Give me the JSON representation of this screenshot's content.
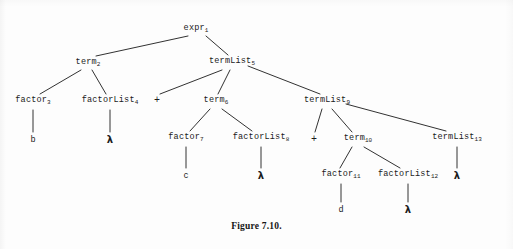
{
  "figure": {
    "caption": "Figure 7.10.",
    "width": 513,
    "height": 249,
    "background_color": "#fdfdfd",
    "ink_color": "#1b1b1b"
  },
  "tree": {
    "nodes": [
      {
        "id": "n1",
        "label": "expr",
        "subscript": "1",
        "x": 196,
        "y": 29
      },
      {
        "id": "n2",
        "label": "term",
        "subscript": "2",
        "x": 88,
        "y": 63
      },
      {
        "id": "n3",
        "label": "factor",
        "subscript": "3",
        "x": 33,
        "y": 101
      },
      {
        "id": "n4",
        "label": "factorList",
        "subscript": "4",
        "x": 110,
        "y": 101
      },
      {
        "id": "n5",
        "label": "termList",
        "subscript": "5",
        "x": 232,
        "y": 62
      },
      {
        "id": "n6",
        "label": "term",
        "subscript": "6",
        "x": 216,
        "y": 101
      },
      {
        "id": "n7",
        "label": "factor",
        "subscript": "7",
        "x": 186,
        "y": 138
      },
      {
        "id": "n8",
        "label": "factorList",
        "subscript": "8",
        "x": 261,
        "y": 138
      },
      {
        "id": "n9",
        "label": "termList",
        "subscript": "9",
        "x": 327,
        "y": 101
      },
      {
        "id": "n10",
        "label": "term",
        "subscript": "10",
        "x": 358,
        "y": 139
      },
      {
        "id": "n11",
        "label": "factor",
        "subscript": "11",
        "x": 341,
        "y": 175
      },
      {
        "id": "n12",
        "label": "factorList",
        "subscript": "12",
        "x": 408,
        "y": 175
      },
      {
        "id": "n13",
        "label": "termList",
        "subscript": "13",
        "x": 457,
        "y": 138
      }
    ],
    "terminals": [
      {
        "id": "t1",
        "text": "b",
        "kind": "symbol",
        "x": 33,
        "y": 140
      },
      {
        "id": "t2",
        "text": "λ",
        "kind": "lambda",
        "x": 110,
        "y": 140
      },
      {
        "id": "t3",
        "text": "+",
        "kind": "plus",
        "x": 157,
        "y": 101
      },
      {
        "id": "t4",
        "text": "c",
        "kind": "symbol",
        "x": 186,
        "y": 176
      },
      {
        "id": "t5",
        "text": "λ",
        "kind": "lambda",
        "x": 261,
        "y": 176
      },
      {
        "id": "t6",
        "text": "+",
        "kind": "plus",
        "x": 314,
        "y": 140
      },
      {
        "id": "t7",
        "text": "d",
        "kind": "symbol",
        "x": 341,
        "y": 210
      },
      {
        "id": "t8",
        "text": "λ",
        "kind": "lambda",
        "x": 408,
        "y": 210
      },
      {
        "id": "t9",
        "text": "λ",
        "kind": "lambda",
        "x": 457,
        "y": 176
      }
    ],
    "edges": [
      {
        "from": "n1",
        "to": "n2",
        "x1": 188,
        "y1": 36,
        "x2": 96,
        "y2": 56
      },
      {
        "from": "n1",
        "to": "n5",
        "x1": 206,
        "y1": 36,
        "x2": 228,
        "y2": 55
      },
      {
        "from": "n2",
        "to": "n3",
        "x1": 81,
        "y1": 70,
        "x2": 40,
        "y2": 94
      },
      {
        "from": "n2",
        "to": "n4",
        "x1": 92,
        "y1": 70,
        "x2": 106,
        "y2": 94
      },
      {
        "from": "n3",
        "to": "t1",
        "x1": 33,
        "y1": 110,
        "x2": 33,
        "y2": 132
      },
      {
        "from": "n4",
        "to": "t2",
        "x1": 110,
        "y1": 110,
        "x2": 110,
        "y2": 132
      },
      {
        "from": "n5",
        "to": "t3",
        "x1": 222,
        "y1": 70,
        "x2": 160,
        "y2": 94
      },
      {
        "from": "n5",
        "to": "n6",
        "x1": 230,
        "y1": 70,
        "x2": 218,
        "y2": 94
      },
      {
        "from": "n5",
        "to": "n9",
        "x1": 248,
        "y1": 66,
        "x2": 320,
        "y2": 94
      },
      {
        "from": "n6",
        "to": "n7",
        "x1": 210,
        "y1": 109,
        "x2": 190,
        "y2": 131
      },
      {
        "from": "n6",
        "to": "n8",
        "x1": 222,
        "y1": 109,
        "x2": 252,
        "y2": 131
      },
      {
        "from": "n7",
        "to": "t4",
        "x1": 186,
        "y1": 147,
        "x2": 186,
        "y2": 168
      },
      {
        "from": "n8",
        "to": "t5",
        "x1": 261,
        "y1": 147,
        "x2": 261,
        "y2": 168
      },
      {
        "from": "n9",
        "to": "t6",
        "x1": 322,
        "y1": 109,
        "x2": 315,
        "y2": 132
      },
      {
        "from": "n9",
        "to": "n10",
        "x1": 332,
        "y1": 109,
        "x2": 352,
        "y2": 132
      },
      {
        "from": "n9",
        "to": "n13",
        "x1": 346,
        "y1": 104,
        "x2": 446,
        "y2": 131
      },
      {
        "from": "n10",
        "to": "n11",
        "x1": 352,
        "y1": 147,
        "x2": 340,
        "y2": 168
      },
      {
        "from": "n10",
        "to": "n12",
        "x1": 364,
        "y1": 147,
        "x2": 400,
        "y2": 168
      },
      {
        "from": "n11",
        "to": "t7",
        "x1": 341,
        "y1": 184,
        "x2": 341,
        "y2": 202
      },
      {
        "from": "n12",
        "to": "t8",
        "x1": 408,
        "y1": 184,
        "x2": 408,
        "y2": 202
      },
      {
        "from": "n13",
        "to": "t9",
        "x1": 457,
        "y1": 147,
        "x2": 457,
        "y2": 168
      }
    ]
  }
}
